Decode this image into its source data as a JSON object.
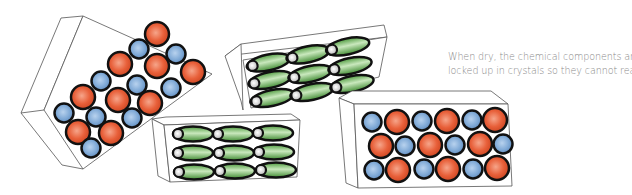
{
  "caption": {
    "line1": "When dry, the chemical components are",
    "line2": "locked up in crystals so they cannot react."
  },
  "colors": {
    "orange": "#e8603a",
    "blue": "#7fa9d6",
    "green": "#5fae4e",
    "outline": "#111111",
    "box_line": "#555555",
    "text": "#8a8a8a"
  },
  "crystals": [
    {
      "name": "tilted-mixed-crystal",
      "kind": "mixed",
      "rows": 3,
      "cols": 7
    },
    {
      "name": "tilted-capsule-crystal",
      "kind": "capsule",
      "rows": 3,
      "cols": 3
    },
    {
      "name": "capsule-crystal",
      "kind": "capsule",
      "rows": 3,
      "cols": 3
    },
    {
      "name": "mixed-crystal",
      "kind": "mixed",
      "rows": 3,
      "cols": 6
    }
  ]
}
